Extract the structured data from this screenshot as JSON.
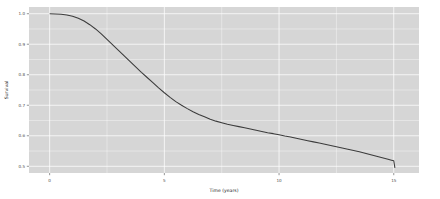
{
  "figure": {
    "name": "survival-curve-figure",
    "background_color": "#ffffff",
    "panel_background_color": "#d6d6d6",
    "gridline_color": "#ffffff",
    "curve_color": "#3b3b3b"
  },
  "chart_data": {
    "type": "line",
    "title": "",
    "subtitle": "",
    "xlabel": "Time (years)",
    "ylabel": "Survival",
    "xlim": [
      -0.9,
      16.1
    ],
    "ylim": [
      0.478,
      1.022
    ],
    "xticks": [
      0,
      5,
      10,
      15
    ],
    "xtick_labels": [
      "0",
      "5",
      "10",
      "15"
    ],
    "yticks": [
      0.5,
      0.6,
      0.7,
      0.8,
      0.9,
      1.0
    ],
    "ytick_labels": [
      "0.5",
      "0.6",
      "0.7",
      "0.8",
      "0.9",
      "1.0"
    ],
    "x_minor_ticks": [
      2.5,
      7.5,
      12.5
    ],
    "y_minor_ticks": [
      0.55,
      0.65,
      0.75,
      0.85,
      0.95
    ],
    "grid": true,
    "legend": false,
    "legend_position": "none",
    "annotations": [],
    "series": [
      {
        "name": "Survival",
        "color": "#3b3b3b",
        "x": [
          0.0,
          0.25,
          0.5,
          0.75,
          1.0,
          1.25,
          1.5,
          1.75,
          2.0,
          2.25,
          2.5,
          2.75,
          3.0,
          3.25,
          3.5,
          3.75,
          4.0,
          4.25,
          4.5,
          4.75,
          5.0,
          5.25,
          5.5,
          5.75,
          6.0,
          6.25,
          6.5,
          6.75,
          7.0,
          7.25,
          7.5,
          7.75,
          8.0,
          8.25,
          8.5,
          8.75,
          9.0,
          9.25,
          9.5,
          9.75,
          10.0,
          10.25,
          10.5,
          10.75,
          11.0,
          11.25,
          11.5,
          11.75,
          12.0,
          12.25,
          12.5,
          12.75,
          13.0,
          13.25,
          13.5,
          13.75,
          14.0,
          14.25,
          14.5,
          14.75,
          14.9,
          15.0,
          15.05
        ],
        "y": [
          1.0,
          0.999,
          0.998,
          0.996,
          0.992,
          0.985,
          0.976,
          0.964,
          0.95,
          0.934,
          0.916,
          0.898,
          0.88,
          0.862,
          0.844,
          0.826,
          0.808,
          0.791,
          0.774,
          0.757,
          0.741,
          0.726,
          0.712,
          0.7,
          0.689,
          0.679,
          0.67,
          0.662,
          0.654,
          0.648,
          0.643,
          0.638,
          0.634,
          0.63,
          0.626,
          0.622,
          0.618,
          0.614,
          0.61,
          0.607,
          0.603,
          0.599,
          0.596,
          0.592,
          0.588,
          0.584,
          0.58,
          0.576,
          0.572,
          0.568,
          0.564,
          0.56,
          0.556,
          0.552,
          0.548,
          0.543,
          0.538,
          0.533,
          0.528,
          0.523,
          0.52,
          0.518,
          0.495
        ]
      }
    ]
  }
}
